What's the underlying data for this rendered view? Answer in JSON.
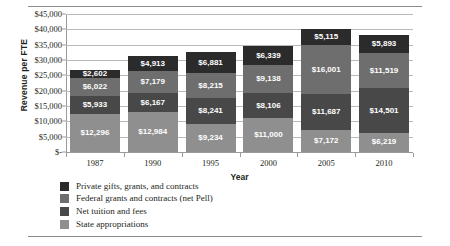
{
  "chart_data": {
    "type": "bar",
    "subtype": "stacked-vertical",
    "title": "",
    "xlabel": "Year",
    "ylabel": "Revenue per FTE",
    "categories": [
      "1987",
      "1990",
      "1995",
      "2000",
      "2005",
      "2010"
    ],
    "ylim": [
      0,
      45000
    ],
    "ytick_labels": [
      "$45,000",
      "$40,000",
      "$35,000",
      "$30,000",
      "$25,000",
      "$20,000",
      "$15,000",
      "$10,000",
      "$5,000",
      "$-"
    ],
    "ytick_values": [
      45000,
      40000,
      35000,
      30000,
      25000,
      20000,
      15000,
      10000,
      5000,
      0
    ],
    "grid": true,
    "legend_position": "bottom-left",
    "stack_order_top_to_bottom": [
      "Private gifts, grants, and contracts",
      "Federal grants and contracts (net Pell)",
      "Net tuition and fees",
      "State appropriations"
    ],
    "series": [
      {
        "name": "Private gifts, grants, and contracts",
        "color": "#2b2b2b",
        "label_color": "#ffffff",
        "values": [
          2602,
          4913,
          6881,
          6339,
          5115,
          5893
        ],
        "labels": [
          "$2,602",
          "$4,913",
          "$6,881",
          "$6,339",
          "$5,115",
          "$5,893"
        ]
      },
      {
        "name": "Federal grants and contracts (net Pell)",
        "color": "#6e6e6e",
        "label_color": "#ffffff",
        "values": [
          6022,
          7179,
          8215,
          9138,
          16001,
          11519
        ],
        "labels": [
          "$6,022",
          "$7,179",
          "$8,215",
          "$9,138",
          "$16,001",
          "$11,519"
        ]
      },
      {
        "name": "Net tuition and fees",
        "color": "#484848",
        "label_color": "#ffffff",
        "values": [
          5933,
          6167,
          8241,
          8106,
          11687,
          14501
        ],
        "labels": [
          "$5,933",
          "$6,167",
          "$8,241",
          "$8,106",
          "$11,687",
          "$14,501"
        ]
      },
      {
        "name": "State appropriations",
        "color": "#8f8f8f",
        "label_color": "#ffffff",
        "values": [
          12296,
          12984,
          9234,
          11000,
          7172,
          6219
        ],
        "labels": [
          "$12,296",
          "$12,984",
          "$9,234",
          "$11,000",
          "$7,172",
          "$6,219"
        ]
      }
    ],
    "totals": [
      26853,
      31243,
      32571,
      34583,
      39975,
      38132
    ]
  }
}
